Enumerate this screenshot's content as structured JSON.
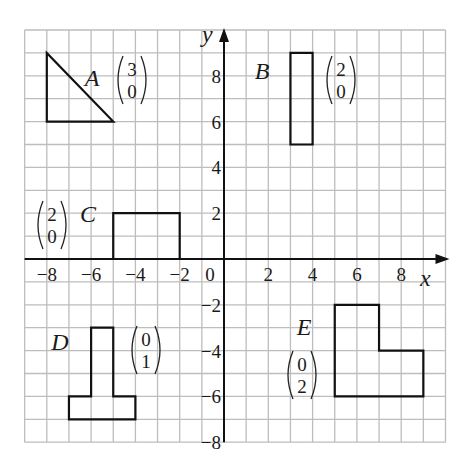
{
  "diagram": {
    "type": "coordinate-grid-translations",
    "grid": {
      "x_min": -9,
      "x_max": 10,
      "y_min": -8,
      "y_max": 10,
      "grid_color": "#bdbdbd",
      "axis_color": "#111111"
    },
    "axes": {
      "x_label": "x",
      "y_label": "y",
      "x_ticks": [
        {
          "value": -8,
          "label": "−8"
        },
        {
          "value": -6,
          "label": "−6"
        },
        {
          "value": -4,
          "label": "−4"
        },
        {
          "value": -2,
          "label": "−2"
        },
        {
          "value": 0,
          "label": "0"
        },
        {
          "value": 2,
          "label": "2"
        },
        {
          "value": 4,
          "label": "4"
        },
        {
          "value": 6,
          "label": "6"
        },
        {
          "value": 8,
          "label": "8"
        }
      ],
      "y_ticks": [
        {
          "value": 8,
          "label": "8"
        },
        {
          "value": 6,
          "label": "6"
        },
        {
          "value": 4,
          "label": "4"
        },
        {
          "value": 2,
          "label": "2"
        },
        {
          "value": -2,
          "label": "−2"
        },
        {
          "value": -4,
          "label": "−4"
        },
        {
          "value": -6,
          "label": "−6"
        },
        {
          "value": -8,
          "label": "−8"
        }
      ]
    },
    "shapes": [
      {
        "id": "A",
        "label": "A",
        "kind": "triangle",
        "vertices": [
          [
            -8,
            9
          ],
          [
            -8,
            6
          ],
          [
            -5,
            6
          ]
        ],
        "vector": {
          "top": "3",
          "bottom": "0"
        }
      },
      {
        "id": "B",
        "label": "B",
        "kind": "rectangle",
        "vertices": [
          [
            3,
            9
          ],
          [
            4,
            9
          ],
          [
            4,
            5
          ],
          [
            3,
            5
          ]
        ],
        "vector": {
          "top": "2",
          "bottom": "0"
        }
      },
      {
        "id": "C",
        "label": "C",
        "kind": "rectangle",
        "vertices": [
          [
            -5,
            0
          ],
          [
            -5,
            2
          ],
          [
            -2,
            2
          ],
          [
            -2,
            0
          ]
        ],
        "vector": {
          "top": "2",
          "bottom": "0"
        }
      },
      {
        "id": "D",
        "label": "D",
        "kind": "T-shape",
        "vertices": [
          [
            -6,
            -3
          ],
          [
            -5,
            -3
          ],
          [
            -5,
            -6
          ],
          [
            -4,
            -6
          ],
          [
            -4,
            -7
          ],
          [
            -7,
            -7
          ],
          [
            -7,
            -6
          ],
          [
            -6,
            -6
          ]
        ],
        "vector": {
          "top": "0",
          "bottom": "1"
        }
      },
      {
        "id": "E",
        "label": "E",
        "kind": "L-shape",
        "vertices": [
          [
            5,
            -2
          ],
          [
            7,
            -2
          ],
          [
            7,
            -4
          ],
          [
            9,
            -4
          ],
          [
            9,
            -6
          ],
          [
            5,
            -6
          ]
        ],
        "vector": {
          "top": "0",
          "bottom": "2"
        }
      }
    ]
  }
}
